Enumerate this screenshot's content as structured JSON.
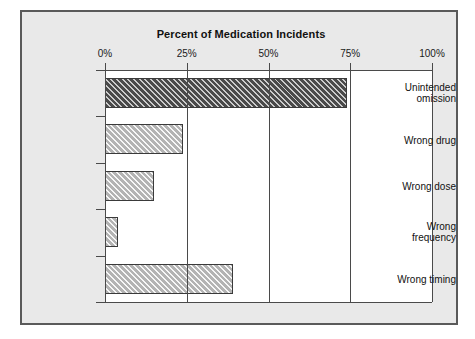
{
  "chart_data": {
    "type": "bar",
    "orientation": "horizontal",
    "title": "Percent of Medication Incidents",
    "xlabel": "",
    "ylabel": "",
    "xlim": [
      0,
      100
    ],
    "xticks": [
      0,
      25,
      50,
      75,
      100
    ],
    "xtick_labels": [
      "0%",
      "25%",
      "50%",
      "75%",
      "100%"
    ],
    "grid": true,
    "grid_axis": "x",
    "legend": false,
    "categories": [
      "Unintended omission",
      "Wrong drug",
      "Wrong dose",
      "Wrong frequency",
      "Wrong timing"
    ],
    "values": [
      74,
      24,
      15,
      4,
      39
    ],
    "bar_styles": [
      "dark-hatched",
      "light-hatched",
      "light-hatched",
      "light-hatched",
      "light-hatched"
    ],
    "colors": {
      "bar_dark": "#4a4a4a",
      "bar_light": "#b3b3b3",
      "bar_edge": "#3a3a3a",
      "axis": "#4a4a4a",
      "plot_background": "#ffffff",
      "figure_background": "#e9e9e9",
      "frame_border": "#5a5a5a",
      "text": "#111111"
    }
  },
  "labels": {
    "cat_0": "Unintended\nomission",
    "cat_1": "Wrong drug",
    "cat_2": "Wrong dose",
    "cat_3": "Wrong\nfrequency",
    "cat_4": "Wrong timing",
    "tick_0": "0%",
    "tick_1": "25%",
    "tick_2": "50%",
    "tick_3": "75%",
    "tick_4": "100%"
  }
}
